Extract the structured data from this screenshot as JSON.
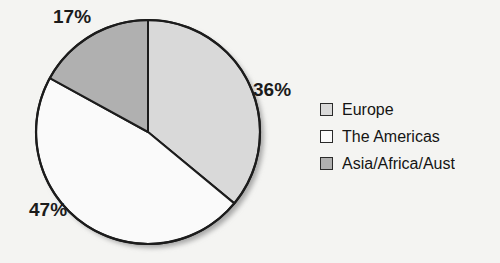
{
  "background_color": "#f4f4f2",
  "chart_data": {
    "type": "pie",
    "title": "",
    "subtitle": "",
    "xlabel": "",
    "ylabel": "",
    "grid": false,
    "legend_position": "right",
    "start_angle_deg": 0,
    "direction": "clockwise",
    "categories": [
      "Europe",
      "The Americas",
      "Asia/Africa/Aust"
    ],
    "values": [
      36,
      47,
      17
    ],
    "value_unit": "%",
    "slice_colors": [
      "#d9d9d9",
      "#fafafa",
      "#b0b0b0"
    ],
    "slice_border_color": "#1c1c1c",
    "data_labels": [
      "36%",
      "47%",
      "17%"
    ],
    "slices": [
      {
        "label": "Europe",
        "value": 36,
        "data_label": "36%",
        "color": "#d9d9d9"
      },
      {
        "label": "The Americas",
        "value": 47,
        "data_label": "47%",
        "color": "#fafafa"
      },
      {
        "label": "Asia/Africa/Aust",
        "value": 17,
        "data_label": "17%",
        "color": "#b0b0b0"
      }
    ],
    "legend": [
      {
        "label": "Europe",
        "color": "#d9d9d9"
      },
      {
        "label": "The Americas",
        "color": "#fafafa"
      },
      {
        "label": "Asia/Africa/Aust",
        "color": "#b0b0b0"
      }
    ]
  },
  "labels": {
    "pct_europe": "36%",
    "pct_americas": "47%",
    "pct_asia": "17%"
  },
  "legend": {
    "items": [
      {
        "label": "Europe"
      },
      {
        "label": "The Americas"
      },
      {
        "label": "Asia/Africa/Aust"
      }
    ]
  }
}
